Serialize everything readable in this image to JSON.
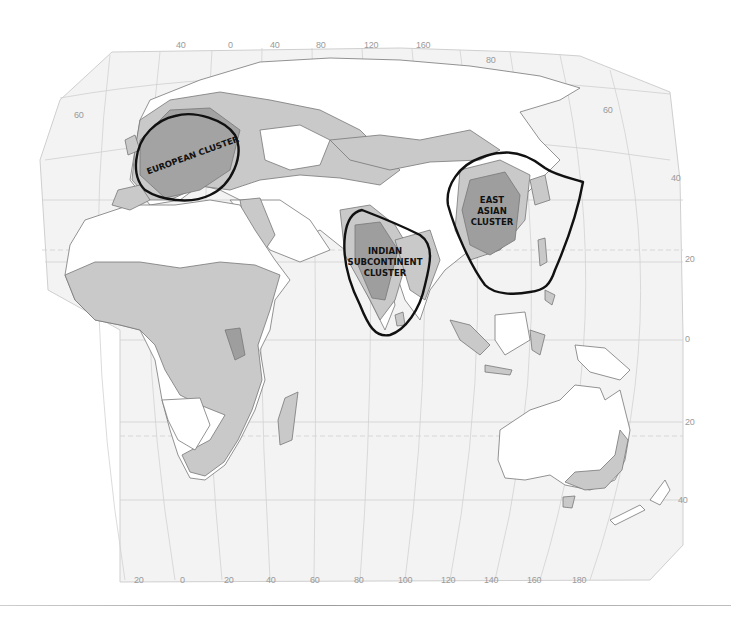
{
  "map": {
    "type": "world-map-eastern-hemisphere",
    "projection_labels": {
      "top_longitudes": [
        "40",
        "0",
        "40",
        "80",
        "120",
        "160"
      ],
      "bottom_longitudes": [
        "20",
        "0",
        "20",
        "40",
        "60",
        "80",
        "100",
        "120",
        "140",
        "160",
        "180"
      ],
      "right_latitudes": [
        "80",
        "60",
        "40",
        "20",
        "0",
        "20",
        "40"
      ],
      "left_latitudes": [
        "60"
      ]
    },
    "clusters": [
      {
        "id": "european",
        "label": "EUROPEAN CLUSTER"
      },
      {
        "id": "indian",
        "label_lines": [
          "INDIAN",
          "SUBCONTINENT",
          "CLUSTER"
        ]
      },
      {
        "id": "east-asian",
        "label_lines": [
          "EAST",
          "ASIAN",
          "CLUSTER"
        ]
      }
    ],
    "colors": {
      "ocean": "#f4f4f4",
      "graticule": "#c9c9c9",
      "land_light": "#ffffff",
      "land_medium": "#c8c8c8",
      "land_dark": "#9e9e9e",
      "border": "#6f6f6f",
      "cluster_outline": "#111111"
    }
  }
}
